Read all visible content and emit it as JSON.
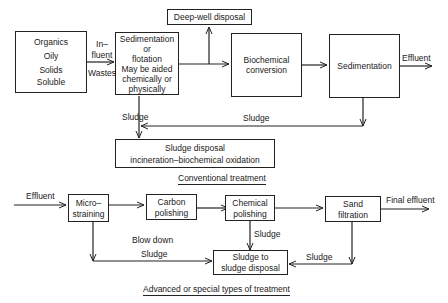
{
  "conventional": {
    "input_box": {
      "lines": [
        "Organics",
        "Oily",
        "Solids",
        "Soluble"
      ]
    },
    "influent_label": {
      "lines": [
        "In–",
        "fluent",
        "Wastes"
      ]
    },
    "sedimentation_flotation": {
      "lines": [
        "Sedimentation",
        "or",
        "flotation",
        "May be aided",
        "chemically or",
        "physically"
      ]
    },
    "deep_well": "Deep-well disposal",
    "biochemical": {
      "lines": [
        "Biochemical",
        "conversion"
      ]
    },
    "sedimentation": "Sedimentation",
    "effluent_label": "Effluent",
    "sludge_left_label": "Sludge",
    "sludge_return_label": "Sludge",
    "sludge_disposal": {
      "lines": [
        "Sludge disposal",
        "incineration–biochemical oxidation"
      ]
    },
    "caption": "Conventional treatment"
  },
  "advanced": {
    "effluent_in_label": "Effluent",
    "microstraining": {
      "lines": [
        "Micro–",
        "straining"
      ]
    },
    "carbon_polishing": {
      "lines": [
        "Carbon",
        "polishing"
      ]
    },
    "chemical_polishing": {
      "lines": [
        "Chemical",
        "polishing"
      ]
    },
    "sand_filtration": {
      "lines": [
        "Sand",
        "filtration"
      ]
    },
    "final_effluent_label": "Final effluent",
    "blow_down_label": "Blow down",
    "sludge_left_label": "Sludge",
    "sludge_mid_label": "Sludge",
    "sludge_right_label": "Sludge",
    "sludge_to_disposal": {
      "lines": [
        "Sludge to",
        "sludge disposal"
      ]
    },
    "caption": "Advanced or special types of treatment"
  }
}
